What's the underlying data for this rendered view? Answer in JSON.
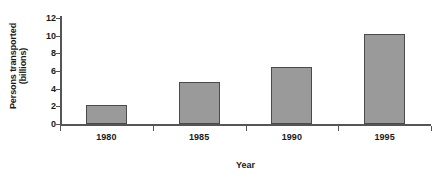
{
  "chart_data": {
    "type": "bar",
    "title": "",
    "subtitle": "",
    "xlabel": "Year",
    "ylabel": "Persons transported (billions)",
    "ylabel_lines": [
      "Persons transported",
      "(billions)"
    ],
    "categories": [
      "1980",
      "1985",
      "1990",
      "1995"
    ],
    "values": [
      2.1,
      4.8,
      6.4,
      10.2
    ],
    "series": [
      {
        "name": "Persons transported",
        "values": [
          2.1,
          4.8,
          6.4,
          10.2
        ]
      }
    ],
    "ylim": [
      0,
      12
    ],
    "yticks": [
      0,
      2,
      4,
      6,
      8,
      10,
      12
    ],
    "ytick_labels": [
      "0",
      "2",
      "4",
      "6",
      "8",
      "10",
      "12"
    ],
    "xtick_labels": [
      "1980",
      "1985",
      "1990",
      "1995"
    ],
    "grid": false,
    "legend": false,
    "legend_position": "none",
    "annotations": [],
    "colors": {
      "bar_fill": "#9a9a9a",
      "bar_stroke": "#4a4a4a",
      "axis": "#555555",
      "text": "#1a1a1a",
      "background": "#ffffff"
    }
  }
}
